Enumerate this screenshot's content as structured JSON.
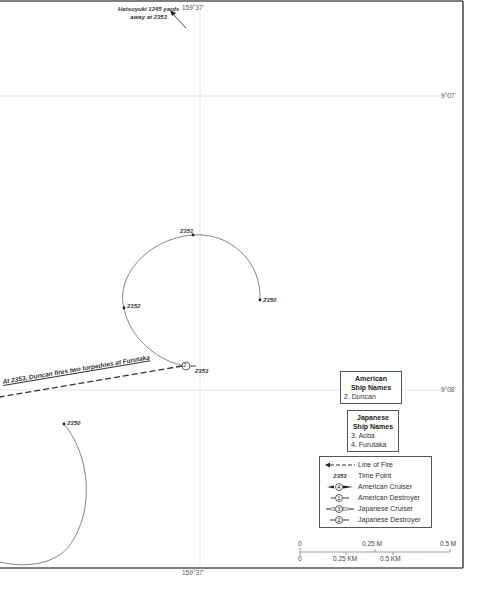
{
  "map": {
    "annotation_top": {
      "line1": "Hatsuyuki 1245 yards",
      "line2": "away at 2353"
    },
    "meridian_top": "159°37'",
    "meridian_bottom": "159°37'",
    "parallel_upper": "9°07'",
    "parallel_lower": "9°08'",
    "fire_annotation": "At 2353, Duncan fires two torpedoes at Furutaka",
    "time_points": [
      {
        "label": "2351"
      },
      {
        "label": "2350"
      },
      {
        "label": "2352"
      },
      {
        "label": "2353"
      },
      {
        "label": "2350"
      }
    ],
    "ship_marker": "2"
  },
  "american_ships": {
    "title_line1": "American",
    "title_line2": "Ship Names",
    "items": [
      "2. Duncan"
    ]
  },
  "japanese_ships": {
    "title_line1": "Japanese",
    "title_line2": "Ship Names",
    "items": [
      "3. Aoba",
      "4. Furutaka"
    ]
  },
  "legend": {
    "items": [
      {
        "symbol": "line-of-fire",
        "label": "Line of Fire"
      },
      {
        "symbol": "2353",
        "label": "Time Point"
      },
      {
        "symbol": "4",
        "label": "American Cruiser"
      },
      {
        "symbol": "1",
        "label": "American Destroyer"
      },
      {
        "symbol": "3",
        "label": "Japanese Cruiser"
      },
      {
        "symbol": "2",
        "label": "Japanese Destroyer"
      }
    ]
  },
  "scale": {
    "miles": [
      "0",
      "0.25 M",
      "0.5 M"
    ],
    "km": [
      "0",
      "0.25 KM",
      "0.5 KM"
    ]
  },
  "colors": {
    "border": "#444444",
    "grid": "#cccccc",
    "track": "#555555",
    "fire": "#333333"
  }
}
